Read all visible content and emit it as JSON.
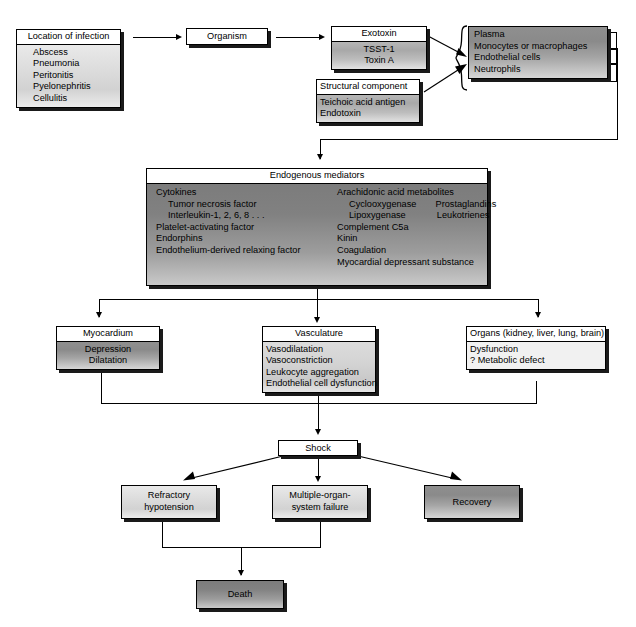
{
  "diagram": {
    "nodes": {
      "location": {
        "header": "Location of infection",
        "items": [
          "Abscess",
          "Pneumonia",
          "Peritonitis",
          "Pyelonephritis",
          "Cellulitis"
        ]
      },
      "organism": {
        "label": "Organism"
      },
      "exotoxin": {
        "header": "Exotoxin",
        "items": [
          "TSST-1",
          "Toxin A"
        ]
      },
      "structural": {
        "header": "Structural component",
        "items": [
          "Teichoic acid antigen",
          "Endotoxin"
        ]
      },
      "targets": {
        "items": [
          "Plasma",
          "Monocytes or macrophages",
          "Endothelial cells",
          "Neutrophils"
        ]
      },
      "mediators": {
        "header": "Endogenous mediators",
        "left_column": [
          "Cytokines",
          "Tumor necrosis factor",
          "Interleukin-1, 2, 6, 8 . . .",
          "Platelet-activating factor",
          "Endorphins",
          "Endothelium-derived relaxing factor"
        ],
        "right_column": [
          "Arachidonic acid metabolites",
          "Cyclooxygenase",
          "Prostaglandins",
          "Lipoxygenase",
          "Leukotrienes",
          "Complement C5a",
          "Kinin",
          "Coagulation",
          "Myocardial depressant substance"
        ]
      },
      "myocardium": {
        "header": "Myocardium",
        "items": [
          "Depression",
          "Dilatation"
        ]
      },
      "vasculature": {
        "header": "Vasculature",
        "items": [
          "Vasodilatation",
          "Vasoconstriction",
          "Leukocyte aggregation",
          "Endothelial cell dysfunction"
        ]
      },
      "organs": {
        "header": "Organs (kidney, liver, lung, brain)",
        "items": [
          "Dysfunction",
          "? Metabolic defect"
        ]
      },
      "shock": {
        "label": "Shock"
      },
      "refractory": {
        "line1": "Refractory",
        "line2": "hypotension"
      },
      "mosf": {
        "line1": "Multiple-organ-",
        "line2": "system failure"
      },
      "recovery": {
        "label": "Recovery"
      },
      "death": {
        "label": "Death"
      }
    },
    "colors": {
      "stroke": "#000000",
      "shadow": "#1a1a1a",
      "fill_light": "#dedede",
      "fill_mid": "#a8a8a8",
      "fill_dark": "#8a8a8a",
      "background": "#ffffff"
    }
  }
}
